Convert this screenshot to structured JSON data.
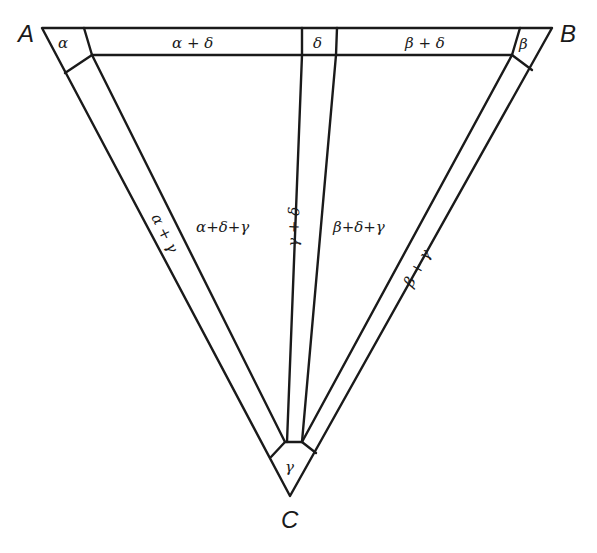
{
  "diagram": {
    "type": "triangular-region-diagram",
    "vertices": {
      "A": {
        "label": "A"
      },
      "B": {
        "label": "B"
      },
      "C": {
        "label": "C"
      }
    },
    "corner_cells": {
      "alpha": "α",
      "beta": "β",
      "gamma": "γ"
    },
    "top_band": {
      "left": "α + δ",
      "center": "δ",
      "right": "β + δ"
    },
    "side_strips": {
      "left": "α + γ",
      "center": "γ + δ",
      "right": "β + γ"
    },
    "regions": {
      "left": "α+δ+γ",
      "right": "β+δ+γ"
    },
    "colors": {
      "stroke": "#1a1a1a",
      "background": "#ffffff"
    }
  }
}
